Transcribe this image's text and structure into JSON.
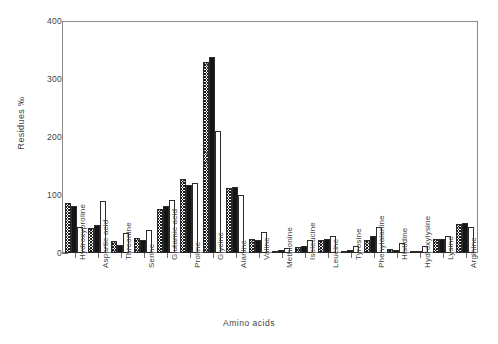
{
  "chart_data": {
    "type": "bar",
    "title": "",
    "xlabel": "Amino acids",
    "ylabel": "Residues ‰",
    "ylim": [
      0,
      400
    ],
    "yticks": [
      0,
      100,
      200,
      300,
      400
    ],
    "grid": false,
    "legend": "none",
    "categories": [
      "Hydroxyproline",
      "Aspartic acid",
      "Threonine",
      "Serine",
      "Glutamic acid",
      "Proline",
      "Glycine",
      "Alanine",
      "Valine",
      "Methionine",
      "Isoleucine",
      "Leucine",
      "Tyrosine",
      "Phenylalanine",
      "Histidine",
      "Hydroxylysine",
      "Lysine",
      "Arginine"
    ],
    "series": [
      {
        "name": "series-1",
        "fill": "hatched",
        "values": [
          86,
          44,
          20,
          26,
          76,
          128,
          330,
          112,
          25,
          4,
          10,
          22,
          3,
          22,
          7,
          2,
          25,
          50
        ]
      },
      {
        "name": "series-2",
        "fill": "solid-black",
        "values": [
          82,
          48,
          14,
          22,
          82,
          118,
          340,
          115,
          22,
          5,
          13,
          25,
          5,
          30,
          6,
          3,
          25,
          52
        ]
      },
      {
        "name": "series-3",
        "fill": "open-white",
        "values": [
          45,
          90,
          35,
          40,
          92,
          122,
          212,
          100,
          37,
          8,
          22,
          30,
          12,
          45,
          18,
          12,
          30,
          45
        ]
      }
    ]
  }
}
